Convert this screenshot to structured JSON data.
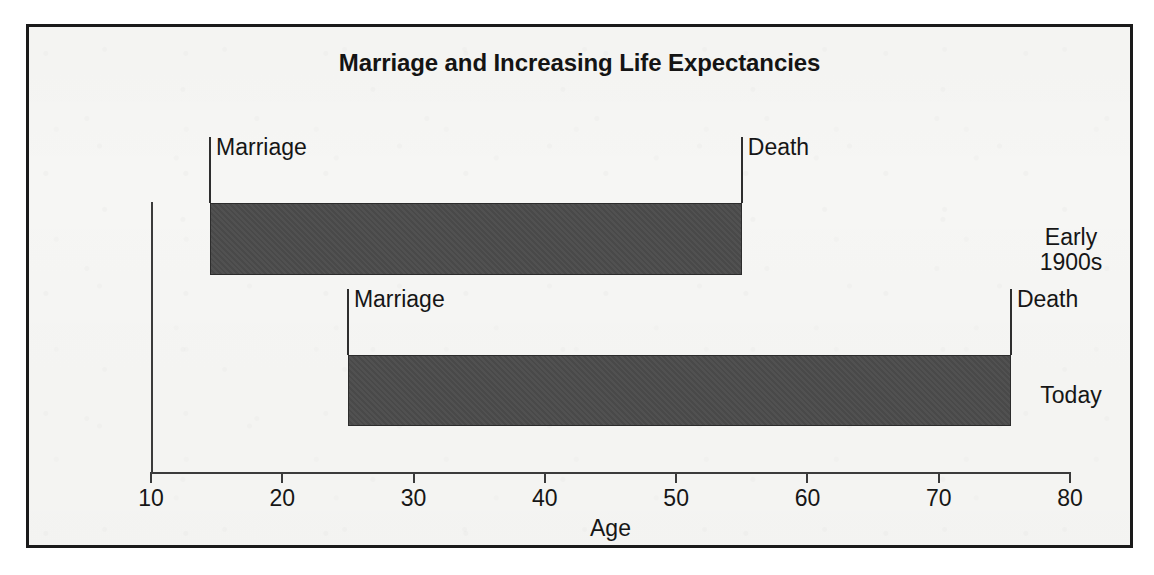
{
  "figure": {
    "title": "Marriage and Increasing Life Expectancies",
    "colors": {
      "bar_fill": "#4b4b4b",
      "bar_stroke": "#2c2c2c",
      "axis": "#3b3b3b",
      "text": "#161616",
      "paper": "#f6f6f4",
      "border": "#1a1a1a"
    }
  },
  "chart_data": {
    "type": "bar",
    "orientation": "horizontal",
    "subtype": "range-bar",
    "title": "Marriage and Increasing Life Expectancies",
    "xlabel": "Age",
    "ylabel": "",
    "xlim": [
      10,
      80
    ],
    "xticks": [
      10,
      20,
      30,
      40,
      50,
      60,
      70,
      80
    ],
    "xtick_labels": [
      "10",
      "20",
      "30",
      "40",
      "50",
      "60",
      "70",
      "80"
    ],
    "grid": false,
    "legend": false,
    "categories": [
      "Early 1900s",
      "Today"
    ],
    "series": [
      {
        "name": "Marriage",
        "values": [
          14.5,
          25.0
        ]
      },
      {
        "name": "Death",
        "values": [
          55.0,
          75.5
        ]
      }
    ],
    "bars": [
      {
        "category": "Early 1900s",
        "category_lines": [
          "Early",
          "1900s"
        ],
        "start": 14.5,
        "end": 55.0,
        "span": 40.5,
        "start_label": "Marriage",
        "end_label": "Death"
      },
      {
        "category": "Today",
        "category_lines": [
          "Today"
        ],
        "start": 25.0,
        "end": 75.5,
        "span": 50.5,
        "start_label": "Marriage",
        "end_label": "Death"
      }
    ],
    "annotations": [
      {
        "text": "Marriage",
        "bar": "Early 1900s",
        "at": 14.5
      },
      {
        "text": "Death",
        "bar": "Early 1900s",
        "at": 55.0
      },
      {
        "text": "Marriage",
        "bar": "Today",
        "at": 25.0
      },
      {
        "text": "Death",
        "bar": "Today",
        "at": 75.5
      }
    ]
  }
}
